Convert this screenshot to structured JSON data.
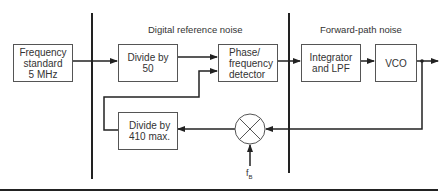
{
  "diagram": {
    "type": "block-diagram",
    "section_labels": {
      "digital_reference_noise": "Digital reference noise",
      "forward_path_noise": "Forward-path noise"
    },
    "blocks": {
      "frequency_standard": "Frequency\nstandard\n5 MHz",
      "divide_by_50": "Divide by\n50",
      "phase_frequency_detector": "Phase/\nfrequency\ndetector",
      "integrator_lpf": "Integrator\nand LPF",
      "vco": "VCO",
      "divide_by_410": "Divide by\n410 max."
    },
    "mixer": {
      "symbol": "mixer",
      "input_label_base": "f",
      "input_label_sub": "B"
    },
    "connections": [
      {
        "from": "frequency_standard",
        "to": "divide_by_50"
      },
      {
        "from": "divide_by_50",
        "to": "phase_frequency_detector"
      },
      {
        "from": "phase_frequency_detector",
        "to": "integrator_lpf"
      },
      {
        "from": "integrator_lpf",
        "to": "vco"
      },
      {
        "from": "vco",
        "to": "output"
      },
      {
        "from": "vco",
        "to": "mixer"
      },
      {
        "from": "fB",
        "to": "mixer"
      },
      {
        "from": "mixer",
        "to": "divide_by_410"
      },
      {
        "from": "divide_by_410",
        "to": "phase_frequency_detector"
      }
    ],
    "colors": {
      "line": "#222222",
      "box_border": "#555555",
      "text": "#333333"
    }
  }
}
